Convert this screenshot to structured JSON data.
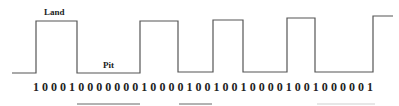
{
  "diagram": {
    "labels": {
      "land": "Land",
      "pit": "Pit"
    },
    "bit_string": "10001000000010000100100100001001000001",
    "waveform": {
      "low_y": 73,
      "high_y": 21,
      "points": [
        [
          12,
          73
        ],
        [
          36,
          73
        ],
        [
          36,
          21
        ],
        [
          77,
          21
        ],
        [
          77,
          73
        ],
        [
          140,
          73
        ],
        [
          140,
          21
        ],
        [
          178,
          21
        ],
        [
          178,
          72
        ],
        [
          213,
          72
        ],
        [
          213,
          20
        ],
        [
          243,
          20
        ],
        [
          243,
          72
        ],
        [
          287,
          72
        ],
        [
          287,
          18
        ],
        [
          315,
          18
        ],
        [
          315,
          72
        ],
        [
          373,
          72
        ],
        [
          373,
          16
        ],
        [
          393,
          16
        ]
      ],
      "segments": [
        {
          "type": "pit",
          "x_start": 12,
          "x_end": 36
        },
        {
          "type": "land",
          "x_start": 36,
          "x_end": 77
        },
        {
          "type": "pit",
          "x_start": 77,
          "x_end": 140
        },
        {
          "type": "land",
          "x_start": 140,
          "x_end": 178
        },
        {
          "type": "pit",
          "x_start": 178,
          "x_end": 213
        },
        {
          "type": "land",
          "x_start": 213,
          "x_end": 243
        },
        {
          "type": "pit",
          "x_start": 243,
          "x_end": 287
        },
        {
          "type": "land",
          "x_start": 287,
          "x_end": 315
        },
        {
          "type": "pit",
          "x_start": 315,
          "x_end": 373
        },
        {
          "type": "land",
          "x_start": 373,
          "x_end": 393
        }
      ]
    },
    "underlines": [
      {
        "x1": 77,
        "x2": 140,
        "faint": false
      },
      {
        "x1": 179,
        "x2": 212,
        "faint": false
      },
      {
        "x1": 317,
        "x2": 375,
        "faint": true
      }
    ],
    "colors": {
      "line": "#555555",
      "text": "#222222",
      "background": "#ffffff"
    }
  }
}
